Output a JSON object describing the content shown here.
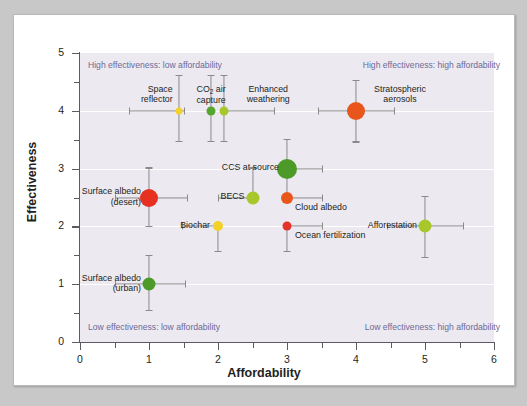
{
  "chart_data": {
    "type": "scatter",
    "title": "",
    "xlabel": "Affordability",
    "ylabel": "Effectiveness",
    "xlim": [
      0,
      6
    ],
    "ylim": [
      0,
      5
    ],
    "xticks": [
      0,
      1,
      2,
      3,
      4,
      5,
      6
    ],
    "yticks": [
      0,
      1,
      2,
      3,
      4,
      5
    ],
    "xtick_labels": [
      "0",
      "1",
      "2",
      "3",
      "4",
      "5",
      "6"
    ],
    "ytick_labels": [
      "0",
      "1",
      "2",
      "3",
      "4",
      "5"
    ],
    "grid": "horizontal-white",
    "legend": "none",
    "annotations": [
      {
        "text": "High effectiveness: low affordability",
        "corner": "top-left"
      },
      {
        "text": "High effectiveness: high affordability",
        "corner": "top-right"
      },
      {
        "text": "Low effectiveness: low affordability",
        "corner": "bottom-left"
      },
      {
        "text": "Low effectiveness: high affordability",
        "corner": "bottom-right"
      }
    ],
    "points": [
      {
        "label": "Space reflector",
        "x": 1.43,
        "y": 4,
        "xerr_low": 0.72,
        "xerr_high": 0.08,
        "yerr_low": 0.52,
        "yerr_high": 0.62,
        "color": "#f2d22a",
        "size": 7,
        "label_lines": [
          "Space",
          "reflector"
        ],
        "label_pos": "above-left"
      },
      {
        "label": "CO2 air capture",
        "x": 1.9,
        "y": 4,
        "xerr_low": 0.0,
        "xerr_high": 0.0,
        "yerr_low": 0.52,
        "yerr_high": 0.62,
        "color": "#54a62c",
        "size": 9,
        "label_lines": [
          "CO₂ air",
          "capture"
        ],
        "label_pos": "above"
      },
      {
        "label": "Enhanced weathering",
        "x": 2.09,
        "y": 4,
        "xerr_low": 0.0,
        "xerr_high": 0.72,
        "yerr_low": 0.52,
        "yerr_high": 0.62,
        "color": "#a8c72b",
        "size": 9,
        "label_lines": [
          "Enhanced",
          "weathering"
        ],
        "label_pos": "above-right"
      },
      {
        "label": "Stratospheric aerosols",
        "x": 4,
        "y": 4,
        "xerr_low": 0.55,
        "xerr_high": 0.55,
        "yerr_low": 0.53,
        "yerr_high": 0.53,
        "color": "#e8561b",
        "size": 18,
        "label_lines": [
          "Stratospheric",
          "aerosols"
        ],
        "label_pos": "above-right"
      },
      {
        "label": "CCS at source",
        "x": 3,
        "y": 3,
        "xerr_low": 0.0,
        "xerr_high": 0.5,
        "yerr_low": 0.48,
        "yerr_high": 0.52,
        "color": "#4d9a29",
        "size": 20,
        "label_lines": [
          "CCS at source"
        ],
        "label_pos": "left"
      },
      {
        "label": "Surface albedo (desert)",
        "x": 1,
        "y": 2.5,
        "xerr_low": 0.5,
        "xerr_high": 0.55,
        "yerr_low": 0.5,
        "yerr_high": 0.52,
        "color": "#e53022",
        "size": 18,
        "label_lines": [
          "Surface albedo",
          "(desert)"
        ],
        "label_pos": "left"
      },
      {
        "label": "BECS",
        "x": 2.5,
        "y": 2.5,
        "xerr_low": 0.5,
        "xerr_high": 0.0,
        "yerr_low": 0.0,
        "yerr_high": 0.52,
        "color": "#a8c72b",
        "size": 13,
        "label_lines": [
          "BECS"
        ],
        "label_pos": "left"
      },
      {
        "label": "Cloud albedo",
        "x": 3,
        "y": 2.5,
        "xerr_low": 0.0,
        "xerr_high": 0.5,
        "yerr_low": 0.0,
        "yerr_high": 0.0,
        "color": "#e8561b",
        "size": 12,
        "label_lines": [
          "Cloud albedo"
        ],
        "label_pos": "below-right"
      },
      {
        "label": "Biochar",
        "x": 2,
        "y": 2,
        "xerr_low": 0.52,
        "xerr_high": 0.0,
        "yerr_low": 0.42,
        "yerr_high": 0.0,
        "color": "#f2d22a",
        "size": 10,
        "label_lines": [
          "Biochar"
        ],
        "label_pos": "left"
      },
      {
        "label": "Ocean fertilization",
        "x": 3,
        "y": 2,
        "xerr_low": 0.0,
        "xerr_high": 0.5,
        "yerr_low": 0.42,
        "yerr_high": 0.0,
        "color": "#e5332a",
        "size": 9,
        "label_lines": [
          "Ocean fertilization"
        ],
        "label_pos": "below-right"
      },
      {
        "label": "Afforestation",
        "x": 5,
        "y": 2,
        "xerr_low": 0.55,
        "xerr_high": 0.55,
        "yerr_low": 0.53,
        "yerr_high": 0.53,
        "color": "#a8c72b",
        "size": 13,
        "label_lines": [
          "Afforestation"
        ],
        "label_pos": "left"
      },
      {
        "label": "Surface albedo (urban)",
        "x": 1,
        "y": 1,
        "xerr_low": 0.5,
        "xerr_high": 0.52,
        "yerr_low": 0.45,
        "yerr_high": 0.5,
        "color": "#4d9a29",
        "size": 13,
        "label_lines": [
          "Surface albedo",
          "(urban)"
        ],
        "label_pos": "left"
      }
    ]
  },
  "colors": {
    "panel_background": "#ece9f1",
    "card_background": "#ffffff",
    "page_background": "#c8c8c8",
    "axis": "#5b5b64",
    "gridline": "#ffffff",
    "annotation_text": "#6d6a97",
    "label_text": "#231f20",
    "error_bar": "#8a8a8a"
  }
}
